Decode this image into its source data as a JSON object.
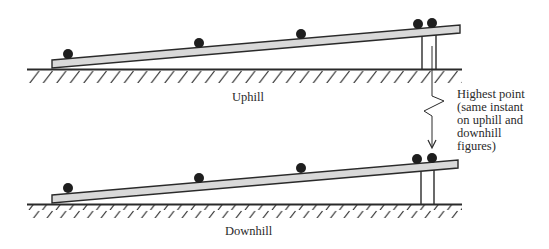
{
  "figure": {
    "type": "diagram",
    "panels": [
      {
        "name": "uphill",
        "label": "Uphill",
        "ground": {
          "x1": 27,
          "x2": 462,
          "y": 69
        },
        "ramp": {
          "left_top": [
            52,
            60
          ],
          "left_bottom": [
            52,
            67
          ],
          "right_top": [
            460,
            25
          ],
          "right_bottom": [
            460,
            33
          ]
        },
        "supports_x": [
          422,
          436
        ],
        "balls": [
          [
            68,
            54
          ],
          [
            199,
            43
          ],
          [
            301,
            34
          ],
          [
            418,
            24
          ],
          [
            432,
            23
          ]
        ]
      },
      {
        "name": "downhill",
        "label": "Downhill",
        "ground": {
          "x1": 27,
          "x2": 462,
          "y": 204
        },
        "ramp": {
          "left_top": [
            52,
            195
          ],
          "left_bottom": [
            52,
            202
          ],
          "right_top": [
            458,
            160
          ],
          "right_bottom": [
            458,
            168
          ]
        },
        "supports_x": [
          421,
          434
        ],
        "balls": [
          [
            68,
            188
          ],
          [
            199,
            178
          ],
          [
            301,
            168
          ],
          [
            417,
            159
          ],
          [
            432,
            158
          ]
        ]
      }
    ],
    "annotation": {
      "lines": [
        "Highest point",
        "(same instant",
        "on uphill and",
        "downhill",
        "figures)"
      ]
    },
    "colors": {
      "ink": "#2a2a2a",
      "ramp_fill": "#d9d9d9",
      "background": "#ffffff"
    }
  }
}
